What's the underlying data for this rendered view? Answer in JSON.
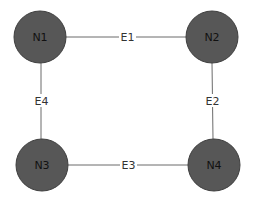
{
  "diagram": {
    "type": "graph",
    "colors": {
      "background": "#ffffff",
      "node_fill": "#575757",
      "node_stroke": "#3f3f3f",
      "edge": "#6b6b6b",
      "node_label": "#111111",
      "edge_label": "#333333"
    },
    "nodes": [
      {
        "id": "N1",
        "label": "N1",
        "cx": 40,
        "cy": 37,
        "r": 26
      },
      {
        "id": "N2",
        "label": "N2",
        "cx": 212,
        "cy": 37,
        "r": 26
      },
      {
        "id": "N3",
        "label": "N3",
        "cx": 42,
        "cy": 165,
        "r": 26
      },
      {
        "id": "N4",
        "label": "N4",
        "cx": 214,
        "cy": 165,
        "r": 26
      }
    ],
    "edges": [
      {
        "id": "E1",
        "label": "E1",
        "from": "N1",
        "to": "N2"
      },
      {
        "id": "E2",
        "label": "E2",
        "from": "N2",
        "to": "N4"
      },
      {
        "id": "E3",
        "label": "E3",
        "from": "N3",
        "to": "N4"
      },
      {
        "id": "E4",
        "label": "E4",
        "from": "N1",
        "to": "N3"
      }
    ]
  }
}
